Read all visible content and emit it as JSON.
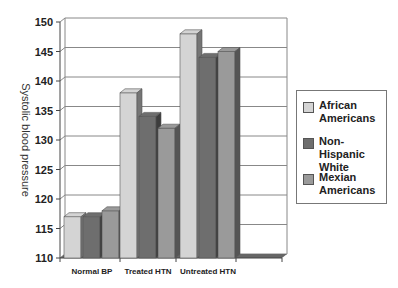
{
  "chart_data": {
    "type": "bar",
    "title": "",
    "xlabel": "",
    "ylabel": "Systolic blood pressure",
    "ylim": [
      110,
      150
    ],
    "yticks": [
      110,
      115,
      120,
      125,
      130,
      135,
      140,
      145,
      150
    ],
    "categories": [
      "Normal BP",
      "Treated HTN",
      "Untreated HTN"
    ],
    "series": [
      {
        "name": "African Americans",
        "values": [
          117,
          138,
          148
        ],
        "color": "#d4d4d4"
      },
      {
        "name": "Non-Hispanic White",
        "values": [
          117,
          134,
          144
        ],
        "color": "#6e6e6e"
      },
      {
        "name": "Mexian Americans",
        "values": [
          118,
          132,
          145
        ],
        "color": "#9a9a9a"
      }
    ],
    "grid": true,
    "legend_position": "right",
    "style": "3d-bars"
  },
  "legend": {
    "items": [
      {
        "label": "African Americans",
        "color": "#d4d4d4"
      },
      {
        "label": "Non-Hispanic White",
        "color": "#6e6e6e"
      },
      {
        "label": "Mexian Americans",
        "color": "#9a9a9a"
      }
    ]
  }
}
